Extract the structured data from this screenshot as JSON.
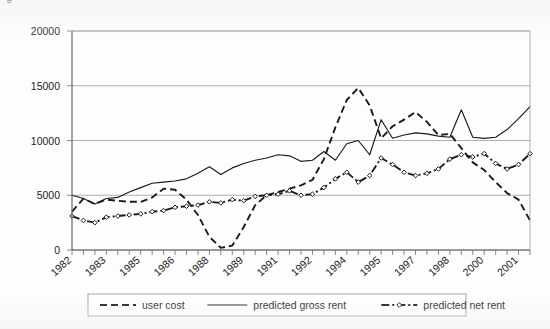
{
  "figure": {
    "caption_sliver": "g",
    "background_color": "#fdfdfd",
    "ink_color": "#1a1a1a"
  },
  "chart_data": {
    "type": "line",
    "title": "",
    "subtitle": "",
    "xlabel": "",
    "ylabel": "",
    "ylim": [
      0,
      20000
    ],
    "ytick_labels": [
      "0",
      "5000",
      "10000",
      "15000",
      "20000"
    ],
    "ytick_values": [
      0,
      5000,
      10000,
      15000,
      20000
    ],
    "grid": true,
    "grid_axis": "y",
    "legend_position": "bottom",
    "x_axis_note": "semiannual observations; labels shown on alternate ticks",
    "xtick_labels": [
      "1982",
      "1983",
      "1985",
      "1986",
      "1988",
      "1989",
      "1991",
      "1992",
      "1994",
      "1995",
      "1997",
      "1998",
      "2000",
      "2001"
    ],
    "x": [
      1982.0,
      1982.5,
      1983.0,
      1983.5,
      1984.0,
      1984.5,
      1985.0,
      1985.5,
      1986.0,
      1986.5,
      1987.0,
      1987.5,
      1988.0,
      1988.5,
      1989.0,
      1989.5,
      1990.0,
      1990.5,
      1991.0,
      1991.5,
      1992.0,
      1992.5,
      1993.0,
      1993.5,
      1994.0,
      1994.5,
      1995.0,
      1995.5,
      1996.0,
      1996.5,
      1997.0,
      1997.5,
      1998.0,
      1998.5,
      1999.0,
      1999.5,
      2000.0,
      2000.5,
      2001.0,
      2001.5,
      2002.0
    ],
    "series": [
      {
        "name": "user cost",
        "style": "dashed",
        "marker": "none",
        "color": "#1a1a1a",
        "values": [
          3500,
          4700,
          4200,
          4600,
          4500,
          4400,
          4400,
          4800,
          5600,
          5500,
          4600,
          3200,
          1200,
          200,
          400,
          2100,
          4100,
          5000,
          5300,
          5600,
          5900,
          6400,
          8300,
          11200,
          13700,
          14800,
          13200,
          10200,
          11300,
          11900,
          12600,
          11700,
          10500,
          10600,
          9300,
          8000,
          7300,
          6200,
          5200,
          4600,
          2700
        ]
      },
      {
        "name": "predicted gross rent",
        "style": "solid",
        "marker": "none",
        "color": "#1a1a1a",
        "values": [
          5000,
          4700,
          4200,
          4700,
          4800,
          5300,
          5700,
          6100,
          6200,
          6300,
          6500,
          7000,
          7600,
          6900,
          7500,
          7900,
          8200,
          8400,
          8700,
          8600,
          8100,
          8200,
          9000,
          8200,
          9700,
          10000,
          8700,
          11900,
          10200,
          10500,
          10700,
          10600,
          10400,
          10300,
          12800,
          10300,
          10200,
          10300,
          11000,
          12000,
          13100
        ]
      },
      {
        "name": "predicted net rent",
        "style": "dash-dot",
        "marker": "diamond",
        "color": "#1a1a1a",
        "values": [
          3100,
          2700,
          2500,
          3000,
          3100,
          3200,
          3300,
          3500,
          3600,
          3900,
          4000,
          4100,
          4400,
          4300,
          4600,
          4500,
          4900,
          5000,
          5100,
          5400,
          5000,
          5100,
          5700,
          6500,
          7100,
          6200,
          6800,
          8400,
          7800,
          7100,
          6800,
          7000,
          7400,
          8300,
          8700,
          8500,
          8800,
          7900,
          7400,
          7800,
          8800
        ]
      }
    ]
  },
  "legend": {
    "entries": [
      {
        "label": "user cost",
        "style": "dashed",
        "marker": "none"
      },
      {
        "label": "predicted gross rent",
        "style": "solid",
        "marker": "none"
      },
      {
        "label": "predicted net rent",
        "style": "dash-dot",
        "marker": "diamond"
      }
    ]
  }
}
